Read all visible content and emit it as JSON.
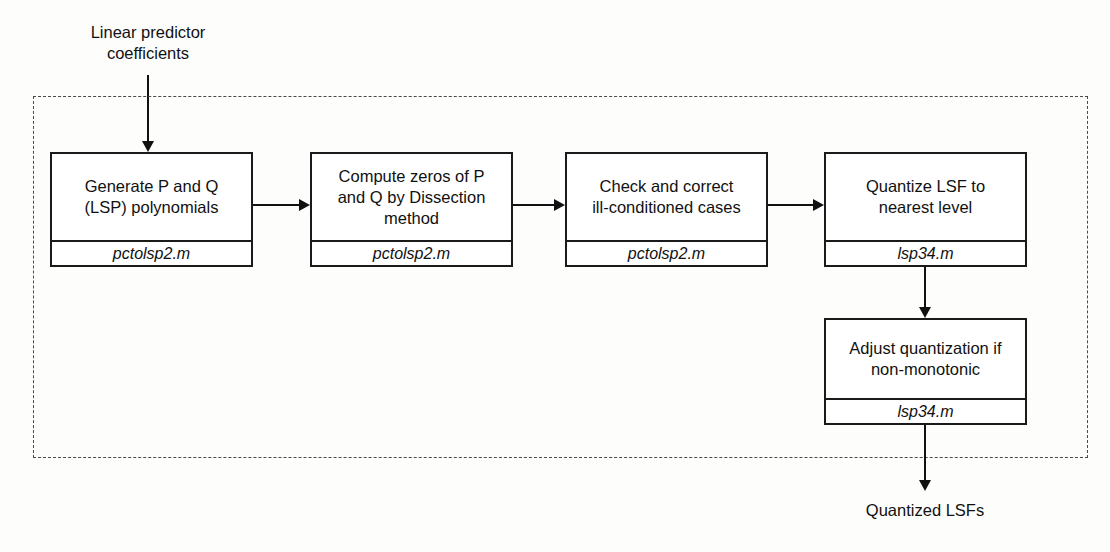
{
  "diagram": {
    "input_label": "Linear predictor\ncoefficients",
    "output_label": "Quantized LSFs",
    "nodes": [
      {
        "title": "Generate P and Q\n(LSP) polynomials",
        "file": "pctolsp2.m"
      },
      {
        "title": "Compute zeros of P\nand Q by Dissection\nmethod",
        "file": "pctolsp2.m"
      },
      {
        "title": "Check and correct\nill-conditioned cases",
        "file": "pctolsp2.m"
      },
      {
        "title": "Quantize LSF to\nnearest level",
        "file": "lsp34.m"
      },
      {
        "title": "Adjust quantization if\nnon-monotonic",
        "file": "lsp34.m"
      }
    ],
    "colors": {
      "stroke": "#111111",
      "box_fill": "#ffffff",
      "dashed_border": "#4a4a4a",
      "background": "#fdfdfc"
    }
  }
}
